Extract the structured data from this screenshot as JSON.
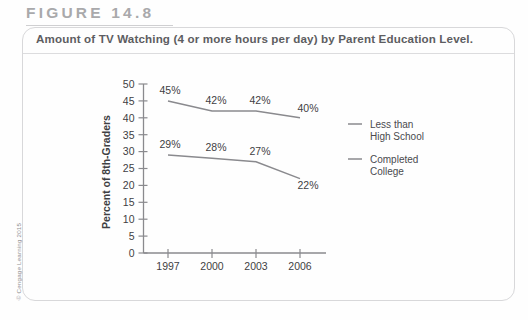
{
  "figure": {
    "label": "FIGURE 14.8",
    "caption": "Amount of TV Watching (4 or more hours per day) by Parent Education Level.",
    "credit": "© Cengage Learning 2015"
  },
  "chart_data": {
    "type": "line",
    "title": "Amount of TV Watching (4 or more hours per day) by Parent Education Level.",
    "xlabel": "",
    "ylabel": "Percent of 8th-Graders",
    "categories": [
      "1997",
      "2000",
      "2003",
      "2006"
    ],
    "x": [
      1997,
      2000,
      2003,
      2006
    ],
    "ylim": [
      0,
      50
    ],
    "ytick_step": 5,
    "yticks": [
      "50",
      "45",
      "40",
      "35",
      "30",
      "25",
      "20",
      "15",
      "10",
      "5",
      "0"
    ],
    "grid": false,
    "legend_position": "right",
    "series": [
      {
        "name": "Less than High School",
        "values": [
          45,
          42,
          42,
          40
        ],
        "labels": [
          "45%",
          "42%",
          "42%",
          "40%"
        ],
        "color": "#8a8a8e"
      },
      {
        "name": "Completed College",
        "values": [
          29,
          28,
          27,
          22
        ],
        "labels": [
          "29%",
          "28%",
          "27%",
          "22%"
        ],
        "color": "#8a8a8e"
      }
    ]
  }
}
